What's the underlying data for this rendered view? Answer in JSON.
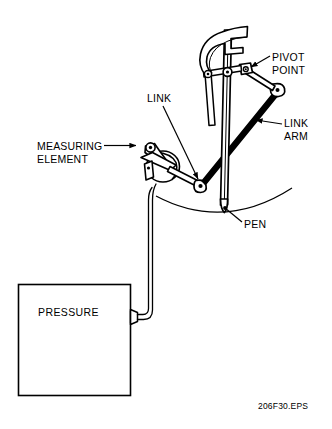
{
  "figure": {
    "id_text": "206F30.EPS",
    "background_color": "#ffffff",
    "line_color": "#000000"
  },
  "labels": {
    "measuring_element": "MEASURING\nELEMENT",
    "link": "LINK",
    "pivot_point": "PIVOT\nPOINT",
    "link_arm": "LINK\nARM",
    "pen": "PEN",
    "pressure": "PRESSURE"
  },
  "components": [
    {
      "name": "pressure-source-box",
      "label": "PRESSURE",
      "shape": "rectangle",
      "x": 18,
      "y": 284,
      "width": 112,
      "height": 112
    },
    {
      "name": "pressure-connector-fitting",
      "shape": "tapered-fitting",
      "x": 128,
      "y": 314
    },
    {
      "name": "capillary-tube",
      "shape": "double-line-tube",
      "from": "pressure-connector-fitting",
      "to": "measuring-element"
    },
    {
      "name": "measuring-element",
      "label": "MEASURING ELEMENT",
      "shape": "bellows-disc-with-bracket",
      "cx": 162,
      "cy": 165,
      "r": 16
    },
    {
      "name": "link",
      "label": "LINK",
      "shape": "slender-bar",
      "from": [
        152,
        165
      ],
      "to": [
        200,
        186
      ]
    },
    {
      "name": "link-joint-lower",
      "shape": "pin-joint",
      "cx": 201,
      "cy": 186
    },
    {
      "name": "link-arm",
      "label": "LINK ARM",
      "shape": "slender-bar",
      "from": [
        201,
        186
      ],
      "to": [
        277,
        92
      ]
    },
    {
      "name": "pivot-point",
      "label": "PIVOT POINT",
      "shape": "pin-joint",
      "cx": 245,
      "cy": 71
    },
    {
      "name": "pen-arm",
      "shape": "vertical-bar",
      "from": [
        226,
        36
      ],
      "to": [
        222,
        212
      ]
    },
    {
      "name": "pen",
      "label": "PEN",
      "shape": "pen-tip",
      "x": 222,
      "y": 212
    },
    {
      "name": "upper-hook-bracket",
      "shape": "c-hook",
      "x": 199,
      "y": 18
    },
    {
      "name": "chart-arc",
      "shape": "arc",
      "from": [
        155,
        196
      ],
      "to": [
        292,
        189
      ]
    }
  ],
  "leaders": [
    {
      "name": "leader-measuring-element",
      "from": [
        105,
        146
      ],
      "to": [
        140,
        146
      ],
      "arrow": true
    },
    {
      "name": "leader-link",
      "from": [
        163,
        106
      ],
      "to": [
        199,
        181
      ],
      "arrow": true
    },
    {
      "name": "leader-pivot-point",
      "from": [
        268,
        57
      ],
      "to": [
        249,
        70
      ],
      "arrow": true
    },
    {
      "name": "leader-link-arm",
      "from": [
        281,
        125
      ],
      "to": [
        255,
        121
      ],
      "arrow": true
    },
    {
      "name": "leader-pen",
      "from": [
        241,
        222
      ],
      "to": [
        224,
        209
      ],
      "arrow": false
    }
  ]
}
